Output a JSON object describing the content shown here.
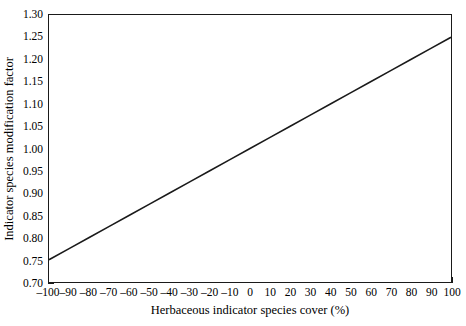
{
  "chart_data": {
    "type": "line",
    "title": "",
    "xlabel": "Herbaceous indicator species cover (%)",
    "ylabel": "Indicator species modification factor",
    "xlim": [
      -100,
      100
    ],
    "ylim": [
      0.7,
      1.3
    ],
    "xticks": [
      -100,
      -90,
      -80,
      -70,
      -60,
      -50,
      -40,
      -30,
      -20,
      -10,
      0,
      10,
      20,
      30,
      40,
      50,
      60,
      70,
      80,
      90,
      100
    ],
    "xticklabels": [
      "–100",
      "–90",
      "–80",
      "–70",
      "–60",
      "–50",
      "–40",
      "–30",
      "–20",
      "–10",
      "0",
      "10",
      "20",
      "30",
      "40",
      "50",
      "60",
      "70",
      "80",
      "90",
      "100"
    ],
    "yticks": [
      0.7,
      0.75,
      0.8,
      0.85,
      0.9,
      0.95,
      1.0,
      1.05,
      1.1,
      1.15,
      1.2,
      1.25,
      1.3
    ],
    "yticklabels": [
      "0.70",
      "0.75",
      "0.80",
      "0.85",
      "0.90",
      "0.95",
      "1.00",
      "1.05",
      "1.10",
      "1.15",
      "1.20",
      "1.25",
      "1.30"
    ],
    "grid": false,
    "legend": false,
    "tick_direction": "in",
    "line_color": "#1a1a1a",
    "frame_color": "#1a1a1a",
    "background": "#ffffff",
    "series": [
      {
        "name": "Indicator species modification factor",
        "x": [
          -100,
          -90,
          -80,
          -70,
          -60,
          -50,
          -40,
          -30,
          -20,
          -10,
          0,
          10,
          20,
          30,
          40,
          50,
          60,
          70,
          80,
          90,
          100
        ],
        "values": [
          0.75,
          0.775,
          0.8,
          0.825,
          0.85,
          0.875,
          0.9,
          0.925,
          0.95,
          0.975,
          1.0,
          1.025,
          1.05,
          1.075,
          1.1,
          1.125,
          1.15,
          1.175,
          1.2,
          1.225,
          1.25
        ]
      }
    ]
  }
}
